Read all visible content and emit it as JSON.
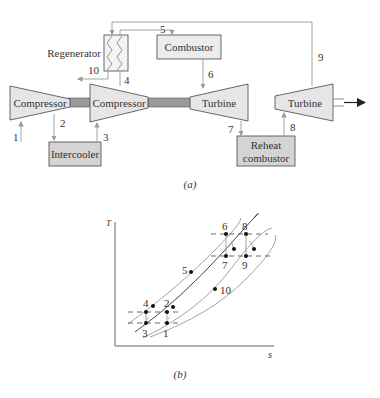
{
  "diagram_a": {
    "caption": "(a)",
    "components": {
      "compressor1": "Compressor",
      "compressor2": "Compressor",
      "turbine1": "Turbine",
      "turbine2": "Turbine",
      "combustor": "Combustor",
      "regenerator": "Regenerator",
      "intercooler": "Intercooler",
      "reheat_line1": "Reheat",
      "reheat_line2": "combustor"
    },
    "states": {
      "s1": "1",
      "s2": "2",
      "s3": "3",
      "s4": "4",
      "s5": "5",
      "s6": "6",
      "s7": "7",
      "s8": "8",
      "s9": "9",
      "s10": "10"
    }
  },
  "diagram_b": {
    "caption": "(b)",
    "y_axis": "T",
    "x_axis": "s",
    "points": {
      "p1": "1",
      "p2": "2",
      "p3": "3",
      "p4": "4",
      "p5": "5",
      "p6": "6",
      "p7": "7",
      "p8": "8",
      "p9": "9",
      "p10": "10"
    }
  },
  "colors": {
    "component_fill": "#e6e6e6",
    "box_fill": "#d4d4d4",
    "shaft": "#9a9a9a",
    "line": "#444444",
    "flow": "#9a9a9a"
  }
}
